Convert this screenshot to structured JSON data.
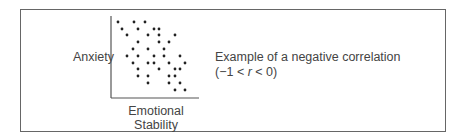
{
  "figure": {
    "y_label": "Anxiety",
    "x_label_line1": "Emotional",
    "x_label_line2": "Stability",
    "caption_line1": "Example of a negative correlation",
    "caption_line2_prefix": "(−1 < ",
    "caption_line2_var": "r",
    "caption_line2_suffix": " < 0)"
  },
  "chart_data": {
    "type": "scatter",
    "title": "Example of a negative correlation (−1 < r < 0)",
    "xlabel": "Emotional Stability",
    "ylabel": "Anxiety",
    "grid": false,
    "axis_ticks": false,
    "note": "Points in pixel coordinates (x right, y down); plot origin at (111,98).",
    "points": [
      [
        118,
        22
      ],
      [
        134,
        22
      ],
      [
        145,
        22
      ],
      [
        122,
        29
      ],
      [
        138,
        29
      ],
      [
        154,
        29
      ],
      [
        159,
        29
      ],
      [
        127,
        35
      ],
      [
        148,
        35
      ],
      [
        159,
        35
      ],
      [
        175,
        35
      ],
      [
        138,
        42
      ],
      [
        159,
        42
      ],
      [
        169,
        42
      ],
      [
        133,
        49
      ],
      [
        148,
        49
      ],
      [
        164,
        49
      ],
      [
        127,
        56
      ],
      [
        138,
        56
      ],
      [
        154,
        56
      ],
      [
        164,
        56
      ],
      [
        180,
        56
      ],
      [
        133,
        63
      ],
      [
        148,
        63
      ],
      [
        154,
        63
      ],
      [
        169,
        63
      ],
      [
        185,
        63
      ],
      [
        138,
        69
      ],
      [
        159,
        69
      ],
      [
        175,
        69
      ],
      [
        180,
        69
      ],
      [
        138,
        76
      ],
      [
        148,
        76
      ],
      [
        169,
        76
      ],
      [
        175,
        76
      ],
      [
        148,
        83
      ],
      [
        169,
        83
      ],
      [
        180,
        83
      ],
      [
        175,
        90
      ],
      [
        185,
        90
      ]
    ]
  }
}
